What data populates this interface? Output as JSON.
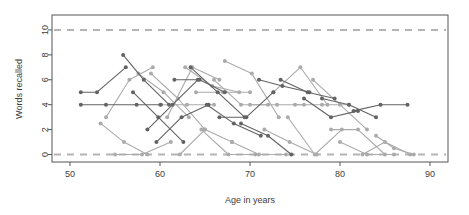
{
  "chart_data": {
    "type": "line",
    "title": "",
    "subtitle": "",
    "xlabel": "Age in years",
    "ylabel": "Words recalled",
    "xlim": [
      48,
      92
    ],
    "ylim": [
      -0.6,
      11.2
    ],
    "xticks": [
      50,
      60,
      70,
      80,
      90
    ],
    "yticks": [
      0,
      2,
      4,
      6,
      8,
      10
    ],
    "grid": false,
    "legend": null,
    "legend_position": "none",
    "annotations": [
      {
        "label": "reference line at ceiling",
        "y": 10,
        "style": "dashed",
        "color": "#b4b4b4"
      },
      {
        "label": "reference line at floor",
        "y": 0,
        "style": "dashed",
        "color": "#b4b4b4"
      }
    ],
    "marker": "filled-circle",
    "marker_radius": 2,
    "colors": {
      "dark_series": "#636363",
      "light_series": "#ababab",
      "reference": "#b4b4b4",
      "axis": "#555555"
    },
    "series": [
      {
        "name": "s01",
        "color": "dark",
        "x": [
          51.2,
          53.0,
          56.2
        ],
        "values": [
          5.0,
          5.0,
          7.0
        ]
      },
      {
        "name": "s02",
        "color": "dark",
        "x": [
          51.2,
          54.0,
          57.4,
          60.1
        ],
        "values": [
          4.0,
          4.0,
          4.0,
          4.0
        ]
      },
      {
        "name": "s03",
        "color": "dark",
        "x": [
          55.9,
          58.2,
          61.0
        ],
        "values": [
          8.0,
          6.0,
          4.0
        ]
      },
      {
        "name": "s04",
        "color": "light",
        "x": [
          54.0,
          56.6,
          59.2
        ],
        "values": [
          3.0,
          6.0,
          7.0
        ]
      },
      {
        "name": "s05",
        "color": "light",
        "x": [
          53.4,
          56.0,
          58.6
        ],
        "values": [
          2.5,
          1.0,
          0.0
        ]
      },
      {
        "name": "s06",
        "color": "light",
        "x": [
          55.0,
          58.0,
          61.2
        ],
        "values": [
          0.0,
          0.0,
          1.0
        ]
      },
      {
        "name": "s07",
        "color": "dark",
        "x": [
          57.0,
          59.8,
          62.6
        ],
        "values": [
          5.0,
          3.0,
          1.0
        ]
      },
      {
        "name": "s08",
        "color": "light",
        "x": [
          57.6,
          60.4,
          63.2
        ],
        "values": [
          6.5,
          5.0,
          3.0
        ]
      },
      {
        "name": "s09",
        "color": "dark",
        "x": [
          58.6,
          61.4,
          64.2
        ],
        "values": [
          2.0,
          4.0,
          6.0
        ]
      },
      {
        "name": "s10",
        "color": "light",
        "x": [
          59.0,
          62.0,
          65.0
        ],
        "values": [
          6.5,
          4.5,
          2.0
        ]
      },
      {
        "name": "s11",
        "color": "dark",
        "x": [
          59.6,
          62.4,
          65.4
        ],
        "values": [
          1.0,
          3.0,
          4.0
        ]
      },
      {
        "name": "s12",
        "color": "light",
        "x": [
          60.0,
          63.0,
          66.0
        ],
        "values": [
          4.0,
          4.0,
          4.0
        ]
      },
      {
        "name": "s13",
        "color": "light",
        "x": [
          60.8,
          63.6,
          66.6
        ],
        "values": [
          3.0,
          7.0,
          6.0
        ]
      },
      {
        "name": "s14",
        "color": "dark",
        "x": [
          61.6,
          64.4,
          67.2
        ],
        "values": [
          6.0,
          6.0,
          5.0
        ]
      },
      {
        "name": "s15",
        "color": "light",
        "x": [
          62.2,
          65.0,
          68.0
        ],
        "values": [
          0.0,
          2.0,
          1.0
        ]
      },
      {
        "name": "s16",
        "color": "light",
        "x": [
          62.8,
          65.8,
          68.8
        ],
        "values": [
          7.0,
          5.5,
          5.0
        ]
      },
      {
        "name": "s17",
        "color": "dark",
        "x": [
          63.4,
          66.4,
          69.4
        ],
        "values": [
          7.0,
          5.0,
          3.0
        ]
      },
      {
        "name": "s18",
        "color": "light",
        "x": [
          64.0,
          67.0,
          70.0
        ],
        "values": [
          5.0,
          5.0,
          5.0
        ]
      },
      {
        "name": "s19",
        "color": "light",
        "x": [
          64.6,
          67.6,
          70.6
        ],
        "values": [
          2.0,
          0.0,
          0.0
        ]
      },
      {
        "name": "s20",
        "color": "dark",
        "x": [
          65.2,
          68.2,
          71.2
        ],
        "values": [
          4.0,
          2.5,
          1.5
        ]
      },
      {
        "name": "s21",
        "color": "light",
        "x": [
          66.0,
          69.0,
          72.0
        ],
        "values": [
          6.0,
          4.0,
          4.0
        ]
      },
      {
        "name": "s22",
        "color": "dark",
        "x": [
          66.6,
          69.6,
          72.6
        ],
        "values": [
          3.0,
          3.0,
          5.0
        ]
      },
      {
        "name": "s23",
        "color": "light",
        "x": [
          67.2,
          70.2,
          73.2
        ],
        "values": [
          7.5,
          6.5,
          3.0
        ]
      },
      {
        "name": "s24",
        "color": "light",
        "x": [
          68.0,
          71.0,
          74.0
        ],
        "values": [
          1.0,
          0.0,
          0.0
        ]
      },
      {
        "name": "s25",
        "color": "dark",
        "x": [
          69.0,
          72.0,
          74.6
        ],
        "values": [
          2.5,
          1.5,
          0.0
        ]
      },
      {
        "name": "s26",
        "color": "light",
        "x": [
          70.0,
          73.0,
          76.0
        ],
        "values": [
          4.0,
          4.0,
          4.0
        ]
      },
      {
        "name": "s27",
        "color": "dark",
        "x": [
          71.0,
          73.6,
          76.6
        ],
        "values": [
          6.0,
          5.5,
          5.0
        ]
      },
      {
        "name": "s28",
        "color": "light",
        "x": [
          71.6,
          74.4,
          77.4
        ],
        "values": [
          2.0,
          1.0,
          0.0
        ]
      },
      {
        "name": "s29",
        "color": "light",
        "x": [
          72.6,
          75.6,
          78.6
        ],
        "values": [
          5.0,
          7.0,
          4.0
        ]
      },
      {
        "name": "s30",
        "color": "dark",
        "x": [
          73.4,
          76.4,
          79.4
        ],
        "values": [
          6.0,
          5.0,
          4.5
        ]
      },
      {
        "name": "s31",
        "color": "light",
        "x": [
          74.2,
          77.2,
          80.2
        ],
        "values": [
          3.0,
          0.0,
          2.0
        ]
      },
      {
        "name": "s32",
        "color": "light",
        "x": [
          75.0,
          78.0,
          81.0
        ],
        "values": [
          4.0,
          4.0,
          4.0
        ]
      },
      {
        "name": "s33",
        "color": "dark",
        "x": [
          76.0,
          79.0,
          82.0
        ],
        "values": [
          4.5,
          3.0,
          3.5
        ]
      },
      {
        "name": "s34",
        "color": "light",
        "x": [
          77.0,
          80.0,
          83.0
        ],
        "values": [
          6.0,
          4.0,
          2.0
        ]
      },
      {
        "name": "s35",
        "color": "dark",
        "x": [
          78.0,
          81.0,
          84.0
        ],
        "values": [
          4.5,
          4.0,
          3.0
        ]
      },
      {
        "name": "s36",
        "color": "light",
        "x": [
          79.0,
          82.0,
          85.0
        ],
        "values": [
          2.0,
          2.0,
          0.0
        ]
      },
      {
        "name": "s37",
        "color": "light",
        "x": [
          80.0,
          83.0,
          86.0
        ],
        "values": [
          1.0,
          0.0,
          0.0
        ]
      },
      {
        "name": "s38",
        "color": "dark",
        "x": [
          81.5,
          84.5,
          87.5
        ],
        "values": [
          3.5,
          4.0,
          4.0
        ]
      },
      {
        "name": "s39",
        "color": "light",
        "x": [
          82.5,
          85.0,
          87.8
        ],
        "values": [
          0.0,
          1.0,
          0.0
        ]
      },
      {
        "name": "s40",
        "color": "light",
        "x": [
          84.0,
          86.0,
          88.2
        ],
        "values": [
          1.5,
          0.5,
          0.0
        ]
      }
    ]
  },
  "axes": {
    "y_title": "Words recalled",
    "x_title": "Age in years",
    "x_tick_labels": [
      "50",
      "60",
      "70",
      "80",
      "90"
    ],
    "y_tick_labels": [
      "0",
      "2",
      "4",
      "6",
      "8",
      "10"
    ]
  }
}
